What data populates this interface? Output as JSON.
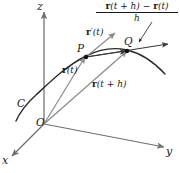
{
  "figure": {
    "background_color": "#ffffff",
    "curve_color": "#2b2b2b",
    "axis_color": "#6f6f6f",
    "vector_color": "#8a8a8a",
    "secant_color": "#3a3a3a",
    "label_color": "#1a1a1a"
  },
  "axes": {
    "x_label": "x",
    "y_label": "y",
    "z_label": "z"
  },
  "points": {
    "origin_label": "O",
    "p_label": "P",
    "q_label": "Q",
    "curve_label": "C"
  },
  "vectors": {
    "r_t": {
      "bold": "r",
      "arg": "(t)"
    },
    "r_t_plus_h": {
      "bold": "r",
      "arg": "(t + h)"
    },
    "r_prime_t": {
      "bold": "r",
      "arg": "′(t)"
    }
  },
  "formula": {
    "numerator_parts": {
      "r1_bold": "r",
      "r1_arg": "(t + h)",
      "minus": " − ",
      "r2_bold": "r",
      "r2_arg": "(t)"
    },
    "denominator": "h"
  }
}
